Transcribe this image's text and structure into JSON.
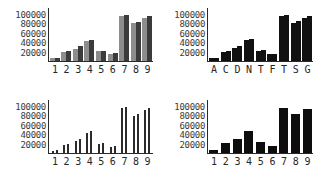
{
  "figure": {
    "panel_count": 4,
    "layout": "2x2 grid of bar charts"
  },
  "chart_data": [
    {
      "type": "bar",
      "title": "",
      "xlabel": "",
      "ylabel": "",
      "panel": "top-left",
      "grid": false,
      "legend": "none",
      "ylim": [
        0,
        110000
      ],
      "yticks": [
        20000,
        40000,
        60000,
        80000,
        100000
      ],
      "ytick_labels": [
        "20000",
        "40000",
        "60000",
        "80000",
        "100000"
      ],
      "categories": [
        "1",
        "2",
        "3",
        "4",
        "5",
        "6",
        "7",
        "8",
        "9"
      ],
      "series": [
        {
          "name": "light",
          "color": "#8d8d8d",
          "values": [
            6000,
            20000,
            26000,
            44000,
            22000,
            16000,
            97000,
            82000,
            92000
          ]
        },
        {
          "name": "dark",
          "color": "#3b3b3b",
          "values": [
            6500,
            22000,
            32000,
            46000,
            22000,
            17000,
            99000,
            85000,
            97000
          ]
        }
      ]
    },
    {
      "type": "bar",
      "title": "",
      "xlabel": "",
      "ylabel": "",
      "panel": "top-right",
      "grid": false,
      "legend": "none",
      "ylim": [
        0,
        110000
      ],
      "yticks": [
        20000,
        40000,
        60000,
        80000,
        100000
      ],
      "ytick_labels": [
        "20000",
        "40000",
        "60000",
        "80000",
        "100000"
      ],
      "categories": [
        "A",
        "C",
        "D",
        "N",
        "T",
        "F",
        "T",
        "S",
        "G"
      ],
      "series": [
        {
          "name": "left",
          "color": "#111111",
          "values": [
            6000,
            20000,
            28000,
            45000,
            22000,
            15000,
            97000,
            83000,
            93000
          ]
        },
        {
          "name": "right",
          "color": "#111111",
          "values": [
            6500,
            22000,
            33000,
            48000,
            23000,
            16000,
            99000,
            86000,
            98000
          ]
        }
      ]
    },
    {
      "type": "bar",
      "title": "",
      "xlabel": "",
      "ylabel": "",
      "panel": "bottom-left",
      "grid": false,
      "legend": "none",
      "ylim": [
        0,
        110000
      ],
      "yticks": [
        20000,
        40000,
        60000,
        80000,
        100000
      ],
      "ytick_labels": [
        "20000",
        "40000",
        "60000",
        "80000",
        "100000"
      ],
      "categories": [
        "1",
        "2",
        "3",
        "4",
        "5",
        "6",
        "7",
        "8",
        "9"
      ],
      "series": [
        {
          "name": "left",
          "color": "#2b2b2b",
          "values": [
            5000,
            17000,
            25000,
            44000,
            20000,
            13000,
            98000,
            80000,
            93000
          ]
        },
        {
          "name": "right",
          "color": "#2b2b2b",
          "values": [
            6000,
            20000,
            30000,
            47000,
            21000,
            15000,
            99000,
            84000,
            97000
          ]
        }
      ]
    },
    {
      "type": "bar",
      "title": "",
      "xlabel": "",
      "ylabel": "",
      "panel": "bottom-right",
      "grid": false,
      "legend": "none",
      "ylim": [
        0,
        110000
      ],
      "yticks": [
        20000,
        40000,
        60000,
        80000,
        100000
      ],
      "ytick_labels": [
        "20000",
        "40000",
        "60000",
        "80000",
        "100000"
      ],
      "categories": [
        "1",
        "2",
        "3",
        "4",
        "5",
        "6",
        "7",
        "8",
        "9"
      ],
      "series": [
        {
          "name": "value",
          "color": "#0d0d0d",
          "values": [
            6000,
            21000,
            31000,
            48000,
            24000,
            16000,
            97000,
            84000,
            95000
          ]
        }
      ]
    }
  ],
  "colors": {
    "background": "#ffffff",
    "axis": "#2a2a2a",
    "tick_text": "#3a3a3a",
    "bar_light": "#8d8d8d",
    "bar_dark": "#3b3b3b",
    "bar_black": "#0d0d0d"
  }
}
